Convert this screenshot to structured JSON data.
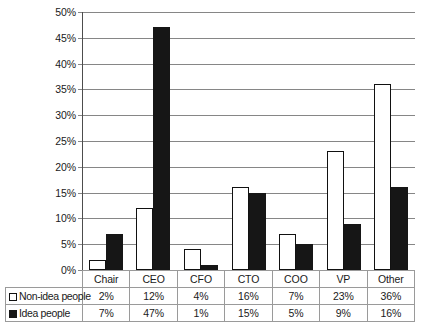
{
  "chart_data": {
    "type": "bar",
    "title": "",
    "xlabel": "",
    "ylabel": "",
    "ylim": [
      0,
      50
    ],
    "grid": true,
    "legend_position": "bottom-table",
    "categories": [
      "Chair",
      "CEO",
      "CFO",
      "CTO",
      "COO",
      "VP",
      "Other"
    ],
    "ytick_labels": [
      "50%",
      "45%",
      "40%",
      "35%",
      "30%",
      "25%",
      "20%",
      "15%",
      "10%",
      "5%",
      "0%"
    ],
    "ytick_values": [
      50,
      45,
      40,
      35,
      30,
      25,
      20,
      15,
      10,
      5,
      0
    ],
    "series": [
      {
        "name": "Non-idea people",
        "marker": "open-square",
        "color": "#ffffff",
        "edge_color": "#111111",
        "values": [
          2,
          12,
          4,
          16,
          7,
          23,
          36
        ],
        "labels": [
          "2%",
          "12%",
          "4%",
          "16%",
          "7%",
          "23%",
          "36%"
        ]
      },
      {
        "name": "Idea people",
        "marker": "filled-square",
        "color": "#161616",
        "edge_color": "#161616",
        "values": [
          7,
          47,
          1,
          15,
          5,
          9,
          16
        ],
        "labels": [
          "7%",
          "47%",
          "1%",
          "15%",
          "5%",
          "9%",
          "16%"
        ]
      }
    ]
  }
}
